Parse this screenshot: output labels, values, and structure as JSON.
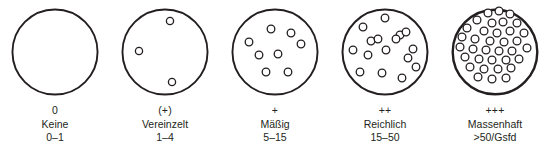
{
  "figure": {
    "background_color": "#ffffff",
    "ink_color": "#231f20"
  },
  "chart_data": {
    "type": "diagram",
    "xlabel": "",
    "ylabel": "",
    "categories": [
      "0",
      "(+)",
      "+",
      "++",
      "+++"
    ],
    "values": [
      0,
      3,
      9,
      16,
      35
    ],
    "legend_position": "below",
    "grid": false,
    "series": [
      {
        "name": "Objekte pro Gesichtsfeld (gezeichnet)",
        "values": [
          0,
          3,
          9,
          16,
          35
        ]
      }
    ],
    "annotations": [
      "0 / Keine / 0–1",
      "(+) / Vereinzelt / 1–4",
      "+ / Mäßig / 5–15",
      "++ / Reichlich / 15–50",
      "+++ / Massenhaft / >50/Gsfd"
    ]
  },
  "grades": [
    {
      "symbol": "0",
      "name": "Keine",
      "range": "0–1",
      "count": 0,
      "field_stroke": 1.9,
      "dot_radius": 0,
      "dots": []
    },
    {
      "symbol": "(+)",
      "name": "Vereinzelt",
      "range": "1–4",
      "count": 3,
      "field_stroke": 1.9,
      "dot_radius": 3.6,
      "dots": [
        [
          60,
          21
        ],
        [
          29,
          51
        ],
        [
          62,
          82
        ]
      ]
    },
    {
      "symbol": "+",
      "name": "Mäßig",
      "range": "5–15",
      "count": 9,
      "field_stroke": 1.9,
      "dot_radius": 3.8,
      "dots": [
        [
          51,
          29
        ],
        [
          71,
          33
        ],
        [
          29,
          42
        ],
        [
          81,
          44
        ],
        [
          39,
          55
        ],
        [
          58,
          54
        ],
        [
          46,
          72
        ],
        [
          68,
          72
        ]
      ]
    },
    {
      "symbol": "++",
      "name": "Reichlich",
      "range": "15–50",
      "count": 16,
      "field_stroke": 2.0,
      "dot_radius": 3.8,
      "dots": [
        [
          55,
          18
        ],
        [
          33,
          27
        ],
        [
          70,
          35
        ],
        [
          76,
          32
        ],
        [
          41,
          41
        ],
        [
          48,
          39
        ],
        [
          66,
          39
        ],
        [
          23,
          50
        ],
        [
          83,
          49
        ],
        [
          38,
          55
        ],
        [
          56,
          50
        ],
        [
          78,
          58
        ],
        [
          30,
          72
        ],
        [
          52,
          73
        ],
        [
          72,
          78
        ],
        [
          86,
          67
        ]
      ]
    },
    {
      "symbol": "+++",
      "name": "Massenhaft",
      "range": ">50/Gsfd",
      "count": 35,
      "field_stroke": 2.4,
      "dot_radius": 3.9,
      "dots": [
        [
          48,
          13
        ],
        [
          59,
          11
        ],
        [
          70,
          14
        ],
        [
          37,
          20
        ],
        [
          52,
          23
        ],
        [
          63,
          22
        ],
        [
          77,
          23
        ],
        [
          27,
          28
        ],
        [
          44,
          31
        ],
        [
          57,
          33
        ],
        [
          70,
          31
        ],
        [
          84,
          33
        ],
        [
          22,
          37
        ],
        [
          35,
          39
        ],
        [
          50,
          41
        ],
        [
          64,
          42
        ],
        [
          77,
          41
        ],
        [
          20,
          47
        ],
        [
          33,
          49
        ],
        [
          46,
          50
        ],
        [
          59,
          51
        ],
        [
          72,
          51
        ],
        [
          87,
          48
        ],
        [
          25,
          57
        ],
        [
          39,
          59
        ],
        [
          52,
          60
        ],
        [
          66,
          60
        ],
        [
          79,
          59
        ],
        [
          30,
          67
        ],
        [
          44,
          69
        ],
        [
          58,
          69
        ],
        [
          71,
          68
        ],
        [
          38,
          77
        ],
        [
          52,
          79
        ],
        [
          66,
          78
        ]
      ]
    }
  ]
}
